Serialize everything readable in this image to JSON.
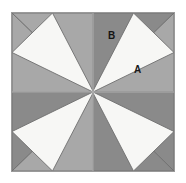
{
  "figure": {
    "canvas": {
      "width": 186,
      "height": 183
    },
    "page_background": "#ffffff",
    "square": {
      "x": 11,
      "y": 12,
      "width": 164,
      "height": 160,
      "border_color": "#9a9a9a",
      "fill_color": "#f7f7f5"
    },
    "quadrant_divider_color": "#b9b9b9",
    "colors": {
      "background": "#f7f7f5",
      "gray_light": "#a8a8a8",
      "gray_dark": "#8a8a8a",
      "outline": "#6f6f6f",
      "border": "#9a9a9a",
      "label_text": "#1a1a1a"
    },
    "labels": [
      {
        "id": "A",
        "text": "A",
        "region": "white-background",
        "x": 122,
        "y": 52
      },
      {
        "id": "B",
        "text": "B",
        "region": "top-dark-triangle",
        "x": 96,
        "y": 18
      }
    ],
    "shapes": {
      "description": "Four gray triangles point inward from the midpoint of each edge toward the center, forming a four-pointed star; each triangle is split by the center axis into a lighter and a darker half.",
      "triangles": [
        {
          "name": "top-light-half",
          "tone": "light",
          "points": "0,0 81,0 81,78"
        },
        {
          "name": "top-dark-half",
          "tone": "dark",
          "points": "81,0 162,0 81,78"
        },
        {
          "name": "right-light-half",
          "tone": "light",
          "points": "162,0 162,79 81,79"
        },
        {
          "name": "right-dark-half",
          "tone": "dark",
          "points": "162,79 162,158 81,79"
        },
        {
          "name": "bottom-dark-half",
          "tone": "dark",
          "points": "162,158 81,158 81,79"
        },
        {
          "name": "bottom-light-half",
          "tone": "light",
          "points": "81,158 0,158 81,79"
        },
        {
          "name": "left-dark-half",
          "tone": "dark",
          "points": "0,158 0,79 81,79"
        },
        {
          "name": "left-light-half",
          "tone": "light",
          "points": "0,79 0,0 81,79"
        }
      ]
    }
  }
}
